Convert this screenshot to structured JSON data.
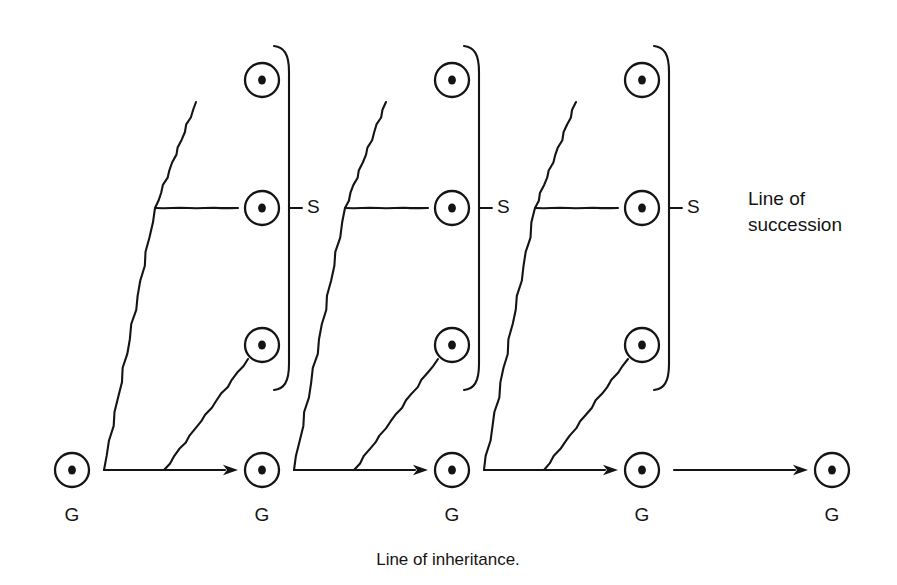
{
  "figure": {
    "background_color": "#ffffff",
    "ink_color": "#141414",
    "width": 897,
    "height": 585
  },
  "labels": {
    "succession_line1": "Line of",
    "succession_line2": "succession",
    "caption": "Line of inheritance.",
    "succession_marker": "S",
    "generation_marker": "G"
  },
  "rows": {
    "top_y": 80,
    "middle_y": 208,
    "lower_y": 345,
    "base_y": 470
  },
  "base_nodes": [
    {
      "name": "generation-1",
      "cx": 72,
      "cy": 470,
      "label": "G",
      "label_y": 516
    },
    {
      "name": "generation-2",
      "cx": 262,
      "cy": 470,
      "label": "G",
      "label_y": 516
    },
    {
      "name": "generation-3",
      "cx": 452,
      "cy": 470,
      "label": "G",
      "label_y": 516
    },
    {
      "name": "generation-4",
      "cx": 642,
      "cy": 470,
      "label": "G",
      "label_y": 516
    },
    {
      "name": "generation-5",
      "cx": 832,
      "cy": 470,
      "label": "G",
      "label_y": 516
    }
  ],
  "groups": [
    {
      "name": "succession-group-1",
      "top_node": {
        "cx": 262,
        "cy": 80
      },
      "middle_node": {
        "cx": 262,
        "cy": 208
      },
      "lower_node": {
        "cx": 262,
        "cy": 345
      },
      "spine_bottom_x": 104,
      "spine_branch_x": 155,
      "spine_top_x": 196,
      "branch_line_end_x": 238,
      "lower_diag_start_x": 164,
      "bracket_x": 289,
      "bracket_top_y": 46,
      "bracket_bottom_y": 390,
      "s_tick_x1": 289,
      "s_tick_x2": 302,
      "s_label_x": 307,
      "s_label_y": 208,
      "arrow_start_x": 104,
      "arrow_end_x": 238,
      "arrow_y": 470
    },
    {
      "name": "succession-group-2",
      "top_node": {
        "cx": 452,
        "cy": 80
      },
      "middle_node": {
        "cx": 452,
        "cy": 208
      },
      "lower_node": {
        "cx": 452,
        "cy": 345
      },
      "spine_bottom_x": 294,
      "spine_branch_x": 345,
      "spine_top_x": 386,
      "branch_line_end_x": 428,
      "lower_diag_start_x": 354,
      "bracket_x": 479,
      "bracket_top_y": 46,
      "bracket_bottom_y": 390,
      "s_tick_x1": 479,
      "s_tick_x2": 492,
      "s_label_x": 497,
      "s_label_y": 208,
      "arrow_start_x": 294,
      "arrow_end_x": 428,
      "arrow_y": 470
    },
    {
      "name": "succession-group-3",
      "top_node": {
        "cx": 642,
        "cy": 80
      },
      "middle_node": {
        "cx": 642,
        "cy": 208
      },
      "lower_node": {
        "cx": 642,
        "cy": 345
      },
      "spine_bottom_x": 484,
      "spine_branch_x": 535,
      "spine_top_x": 576,
      "branch_line_end_x": 618,
      "lower_diag_start_x": 544,
      "bracket_x": 669,
      "bracket_top_y": 46,
      "bracket_bottom_y": 390,
      "s_tick_x1": 669,
      "s_tick_x2": 682,
      "s_label_x": 687,
      "s_label_y": 208,
      "arrow_start_x": 484,
      "arrow_end_x": 618,
      "arrow_y": 470
    }
  ],
  "tail_arrow": {
    "name": "inheritance-arrow-4",
    "start_x": 674,
    "end_x": 808,
    "y": 470
  },
  "side_label": {
    "x": 748,
    "line1_y": 200,
    "line2_y": 226
  },
  "caption": {
    "x": 448,
    "y": 561
  },
  "node_style": {
    "ring_radius": 17,
    "dot_radius": 4.6
  }
}
